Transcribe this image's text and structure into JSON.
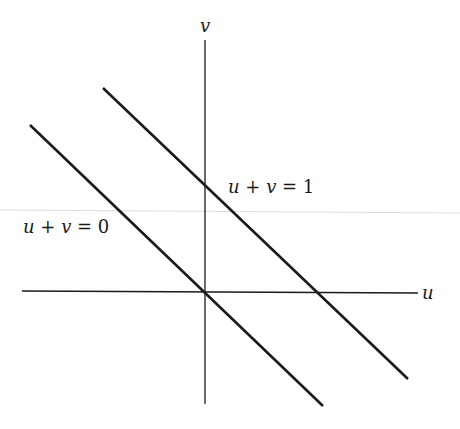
{
  "figure": {
    "axes": {
      "x_label": "u",
      "y_label": "v"
    },
    "lines": [
      {
        "label_parts": [
          "u",
          " + ",
          "v",
          " = 0"
        ],
        "equation": "u + v = 0"
      },
      {
        "label_parts": [
          "u",
          " + ",
          "v",
          " = 1"
        ],
        "equation": "u + v = 1"
      }
    ],
    "colors": {
      "ink": "#1a1a1a",
      "scan_line": "#d8d8d8"
    }
  }
}
